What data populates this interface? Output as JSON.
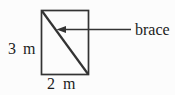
{
  "figure": {
    "description_labels": {
      "height": {
        "value": "3",
        "unit": "m"
      },
      "base": {
        "value": "2",
        "unit": "m"
      },
      "brace": "brace"
    }
  },
  "colors": {
    "ink": "#333333",
    "text": "#1c1c1c",
    "background": "#fcfcfc"
  }
}
